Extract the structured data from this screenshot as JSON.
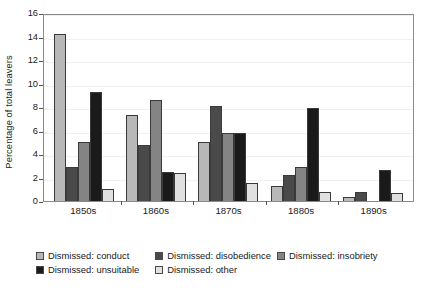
{
  "chart_data": {
    "type": "bar",
    "title": "",
    "xlabel": "",
    "ylabel": "Percentage of total leavers",
    "categories": [
      "1850s",
      "1860s",
      "1870s",
      "1880s",
      "1890s"
    ],
    "ylim": [
      0,
      16
    ],
    "yticks": [
      0,
      2,
      4,
      6,
      8,
      10,
      12,
      14,
      16
    ],
    "ytick_labels": [
      "0",
      "2",
      "4",
      "6",
      "8",
      "10",
      "12",
      "14",
      "16"
    ],
    "grid": true,
    "legend_position": "bottom-left",
    "series": [
      {
        "name": "Dismissed: conduct",
        "color": "#b8b8b8",
        "values": [
          14.2,
          7.35,
          5.0,
          1.25,
          0.3
        ]
      },
      {
        "name": "Dismissed: disobedience",
        "color": "#4a4a4a",
        "values": [
          2.9,
          4.8,
          8.1,
          2.25,
          0.8
        ]
      },
      {
        "name": "Dismissed: insobriety",
        "color": "#848484",
        "values": [
          5.05,
          8.6,
          5.75,
          2.9,
          0.0
        ]
      },
      {
        "name": "Dismissed: unsuitable",
        "color": "#1a1a1a",
        "values": [
          9.25,
          2.45,
          5.75,
          7.9,
          2.6
        ]
      },
      {
        "name": "Dismissed: other",
        "color": "#e0e0e0",
        "values": [
          1.0,
          2.4,
          1.5,
          0.75,
          0.7
        ]
      }
    ]
  }
}
